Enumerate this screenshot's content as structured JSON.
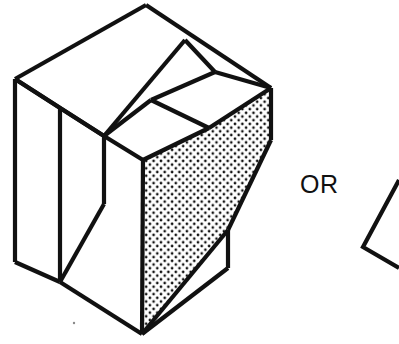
{
  "figure": {
    "type": "technical-line-drawing",
    "canvas": {
      "width": 399,
      "height": 344,
      "background": "#ffffff"
    },
    "stroke": {
      "color": "#111111",
      "width": 4.2,
      "join": "miter",
      "cap": "butt"
    },
    "stipple": {
      "fill_label": "dotted-stipple",
      "dot_color": "#111111",
      "dot_radius": 1.35,
      "spacing": 7.4,
      "background": "#ffffff"
    },
    "label_text": "OR",
    "main_solid": {
      "name": "notched-block",
      "outline_points": "146,5 271,88 271,140 228,230 228,268 142,334 15,262 15,79",
      "faces": [
        {
          "name": "top-left-face",
          "points": "15,79 146,5 185,40 104,136",
          "fill": "#ffffff"
        },
        {
          "name": "top-notch-face",
          "points": "185,40 215,72 151,100 104,136",
          "fill": "#ffffff"
        },
        {
          "name": "top-right-face",
          "points": "215,72 271,88 209,128 151,100",
          "fill": "#ffffff"
        },
        {
          "name": "left-side-face",
          "points": "15,79 104,136 104,204 60,282 60,282 15,262",
          "fill": "#ffffff"
        },
        {
          "name": "left-front-face",
          "points": "104,136 143,160 143,334 60,282 104,204",
          "fill": "#ffffff"
        },
        {
          "name": "stippled-triangle-face",
          "points": "271,88 271,140 228,230 142,334 142,160 209,128",
          "fill": "dotted-stipple"
        },
        {
          "name": "right-lower-face",
          "points": "228,230 228,268 142,334",
          "fill": "#ffffff"
        }
      ],
      "edges": [
        {
          "name": "edge-top-left-upper",
          "x1": 15,
          "y1": 79,
          "x2": 146,
          "y2": 5
        },
        {
          "name": "edge-top-apex-right",
          "x1": 146,
          "y1": 5,
          "x2": 271,
          "y2": 88
        },
        {
          "name": "edge-top-left-inner",
          "x1": 15,
          "y1": 79,
          "x2": 104,
          "y2": 136
        },
        {
          "name": "edge-top-face-front",
          "x1": 104,
          "y1": 136,
          "x2": 185,
          "y2": 40
        },
        {
          "name": "edge-notch-left",
          "x1": 185,
          "y1": 40,
          "x2": 215,
          "y2": 72
        },
        {
          "name": "edge-notch-diagonal",
          "x1": 215,
          "y1": 72,
          "x2": 151,
          "y2": 100
        },
        {
          "name": "edge-notch-lower",
          "x1": 151,
          "y1": 100,
          "x2": 104,
          "y2": 136
        },
        {
          "name": "edge-right-upper-slant",
          "x1": 215,
          "y1": 72,
          "x2": 271,
          "y2": 88
        },
        {
          "name": "edge-inner-top-slant",
          "x1": 151,
          "y1": 100,
          "x2": 209,
          "y2": 128
        },
        {
          "name": "edge-inner-front-slant",
          "x1": 104,
          "y1": 136,
          "x2": 143,
          "y2": 160
        },
        {
          "name": "edge-stipple-top",
          "x1": 143,
          "y1": 160,
          "x2": 209,
          "y2": 128
        },
        {
          "name": "edge-stipple-right-upper",
          "x1": 209,
          "y1": 128,
          "x2": 271,
          "y2": 88
        },
        {
          "name": "edge-right-vertical",
          "x1": 271,
          "y1": 88,
          "x2": 271,
          "y2": 140
        },
        {
          "name": "edge-right-lower-slant",
          "x1": 271,
          "y1": 140,
          "x2": 228,
          "y2": 230
        },
        {
          "name": "edge-right-small-vertical",
          "x1": 228,
          "y1": 230,
          "x2": 228,
          "y2": 268
        },
        {
          "name": "edge-right-bottom-slant",
          "x1": 228,
          "y1": 268,
          "x2": 142,
          "y2": 334
        },
        {
          "name": "edge-stipple-bottom-slant",
          "x1": 228,
          "y1": 230,
          "x2": 142,
          "y2": 334
        },
        {
          "name": "edge-front-vertical",
          "x1": 143,
          "y1": 160,
          "x2": 142,
          "y2": 334
        },
        {
          "name": "edge-bottom-front",
          "x1": 142,
          "y1": 334,
          "x2": 60,
          "y2": 282
        },
        {
          "name": "edge-bottom-left",
          "x1": 60,
          "y1": 282,
          "x2": 15,
          "y2": 262
        },
        {
          "name": "edge-left-vertical-outer",
          "x1": 15,
          "y1": 79,
          "x2": 15,
          "y2": 262
        },
        {
          "name": "edge-left-vertical-inner",
          "x1": 60,
          "y1": 108,
          "x2": 60,
          "y2": 282
        },
        {
          "name": "edge-inner-vertical-front",
          "x1": 104,
          "y1": 136,
          "x2": 104,
          "y2": 204
        },
        {
          "name": "edge-inner-diagonal-lower",
          "x1": 104,
          "y1": 204,
          "x2": 60,
          "y2": 282
        },
        {
          "name": "edge-left-top-inner-short",
          "x1": 15,
          "y1": 79,
          "x2": 60,
          "y2": 108
        },
        {
          "name": "edge-left-inner-to-front",
          "x1": 60,
          "y1": 108,
          "x2": 104,
          "y2": 136
        }
      ]
    },
    "partial_shape": {
      "name": "clipped-chevron",
      "description": "partial outline clipped at right canvas edge",
      "points": "399,180 363,247 399,268"
    },
    "speck": {
      "name": "paper-speck",
      "cx": 74,
      "cy": 323,
      "r": 1.2
    }
  }
}
